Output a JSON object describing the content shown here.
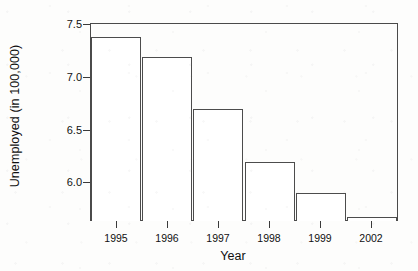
{
  "chart_data": {
    "type": "bar",
    "title": "",
    "xlabel": "Year",
    "ylabel": "Unemployed (in 100,000)",
    "categories": [
      "1995",
      "1996",
      "1997",
      "1998",
      "1999",
      "2002"
    ],
    "values": [
      7.4,
      7.2,
      6.7,
      6.2,
      5.9,
      5.67
    ],
    "ylim": [
      5.63,
      7.53
    ],
    "yticks": [
      7.5,
      7.0,
      6.5,
      6.0
    ],
    "ytick_labels": [
      "7.5",
      "7.0",
      "6.5",
      "6.0"
    ],
    "xtick_labels": [
      "1995",
      "1996",
      "1997",
      "1998",
      "1999",
      "2002"
    ],
    "grid": false,
    "legend": null,
    "bar_fill_color": "#ffffff",
    "bar_border_color": "#4c4c4c",
    "axis_color": "#4a4a4a",
    "background_color": "#fdfdfc"
  },
  "axes": {
    "y_title": "Unemployed (in 100,000)",
    "x_title": "Year"
  }
}
